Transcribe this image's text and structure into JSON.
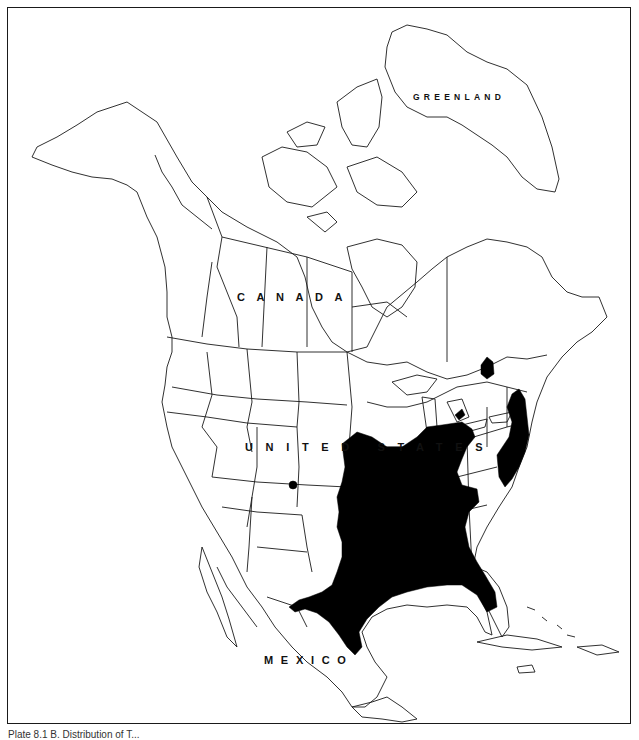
{
  "map": {
    "title": "North America range map",
    "labels": {
      "greenland": "GREENLAND",
      "canada": "CANADA",
      "united_states": "UNITED STATES",
      "mexico": "MEXICO"
    },
    "range_color": "#000000",
    "outline_color": "#1a1a1a",
    "background_color": "#ffffff"
  },
  "caption": "Plate 8.1 B. Distribution of T..."
}
